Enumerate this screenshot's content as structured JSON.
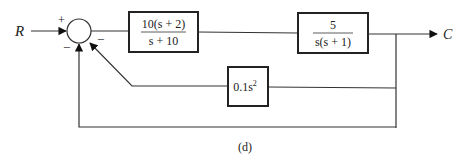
{
  "diagram": {
    "type": "block-diagram",
    "caption": "(d)",
    "input": {
      "label": "R"
    },
    "output": {
      "label": "C"
    },
    "summing_junction": {
      "signs": {
        "input": "+",
        "inner_feedback": "−",
        "outer_feedback": "−"
      }
    },
    "blocks": [
      {
        "id": "G1",
        "numerator": "10(s + 2)",
        "denominator": "s + 10",
        "path": "forward"
      },
      {
        "id": "G2",
        "numerator": "5",
        "denominator": "s(s + 1)",
        "path": "forward"
      },
      {
        "id": "H1",
        "label": "0.1s",
        "exponent": "2",
        "path": "feedback"
      }
    ],
    "connections": [
      {
        "from": "R",
        "to": "summing_junction",
        "sign": "+"
      },
      {
        "from": "summing_junction",
        "to": "G1"
      },
      {
        "from": "G1",
        "to": "G2"
      },
      {
        "from": "G2",
        "to": "C"
      },
      {
        "from": "C",
        "to": "H1",
        "note": "pickoff"
      },
      {
        "from": "H1",
        "to": "summing_junction",
        "sign": "−"
      },
      {
        "from": "C",
        "to": "summing_junction",
        "sign": "−",
        "note": "unity feedback"
      }
    ]
  }
}
